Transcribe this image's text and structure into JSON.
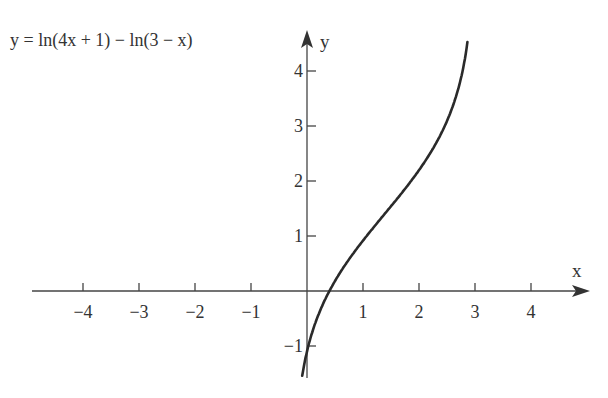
{
  "chart_data": {
    "type": "line",
    "title": "y = ln(4x + 1) − ln(3 − x)",
    "xlabel": "x",
    "ylabel": "y",
    "xlim": [
      -5,
      4.8
    ],
    "ylim": [
      -1.6,
      4.7
    ],
    "grid": false,
    "x_ticks": [
      -4,
      -3,
      -2,
      -1,
      1,
      2,
      3,
      4
    ],
    "x_tick_labels": [
      "−4",
      "−3",
      "−2",
      "−1",
      "1",
      "2",
      "3",
      "4"
    ],
    "y_ticks": [
      -1,
      1,
      2,
      3,
      4
    ],
    "y_tick_labels": [
      "−1",
      "1",
      "2",
      "3",
      "4"
    ],
    "series": [
      {
        "name": "y = ln(4x + 1) − ln(3 − x)",
        "function": "ln(4x+1) - ln(3-x)",
        "x": [
          -0.08,
          0,
          0.1,
          0.25,
          0.4,
          0.6,
          0.8,
          1.0,
          1.25,
          1.5,
          1.75,
          2.0,
          2.25,
          2.5,
          2.65,
          2.75,
          2.82,
          2.86
        ],
        "values": [
          -1.55,
          -1.1,
          -0.75,
          -0.35,
          0.04,
          0.37,
          0.62,
          0.92,
          1.17,
          1.45,
          1.75,
          2.2,
          2.58,
          3.0,
          3.3,
          3.8,
          4.15,
          4.45
        ]
      }
    ],
    "annotations": [
      {
        "text": "y = ln(4x + 1) − ln(3 − x)",
        "position": "top-left"
      }
    ]
  },
  "labels": {
    "equation": "y = ln(4x + 1) − ln(3 − x)",
    "x_axis": "x",
    "y_axis": "y"
  }
}
